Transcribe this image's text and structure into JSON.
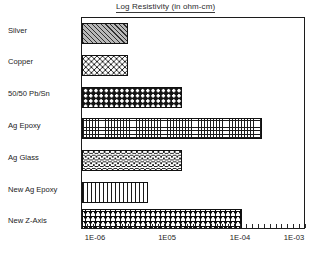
{
  "chart_data": {
    "type": "bar",
    "orientation": "horizontal",
    "title": "Log Resistivity (in ohm-cm)",
    "xlabel": "",
    "ylabel": "",
    "x_tick_labels": [
      "1E-06",
      "1E05",
      "1E-04",
      "1E-03"
    ],
    "x_tick_values": [
      -6,
      -5,
      -4,
      -3
    ],
    "xlim": [
      -6.2,
      -2.85
    ],
    "grid": "dotted-field",
    "legend": "none",
    "categories": [
      "Silver",
      "Copper",
      "50/50 Pb/Sn",
      "Ag Epoxy",
      "Ag Glass",
      "New Ag Epoxy",
      "New Z-Axis"
    ],
    "values": [
      -5.45,
      -5.45,
      -4.72,
      -3.63,
      -4.72,
      -5.18,
      -3.9
    ],
    "value_units": "log10(ohm-cm)",
    "bars": [
      {
        "category": "Silver",
        "value": -5.45,
        "bar_end_px": 128,
        "pattern": "diagonal-hatch",
        "fill": "#b9b9b9"
      },
      {
        "category": "Copper",
        "value": -5.45,
        "bar_end_px": 128,
        "pattern": "open-circles",
        "fill": "#ffffff"
      },
      {
        "category": "50/50 Pb/Sn",
        "value": -4.72,
        "bar_end_px": 182,
        "pattern": "dark-dots",
        "fill": "#141414"
      },
      {
        "category": "Ag Epoxy",
        "value": -3.63,
        "bar_end_px": 262,
        "pattern": "cross-hatch-grid",
        "fill": "#ffffff"
      },
      {
        "category": "Ag Glass",
        "value": -4.72,
        "bar_end_px": 182,
        "pattern": "wavy-bands",
        "fill": "#ffffff"
      },
      {
        "category": "New Ag Epoxy",
        "value": -5.18,
        "bar_end_px": 148,
        "pattern": "vertical-lines",
        "fill": "#ffffff"
      },
      {
        "category": "New Z-Axis",
        "value": -3.9,
        "bar_end_px": 242,
        "pattern": "plus-lattice",
        "fill": "#ffffff"
      }
    ],
    "colors": {
      "axis": "#1c1c1c",
      "text": "#232323",
      "grid_dot": "#8e8e8e",
      "background": "#ffffff"
    }
  }
}
